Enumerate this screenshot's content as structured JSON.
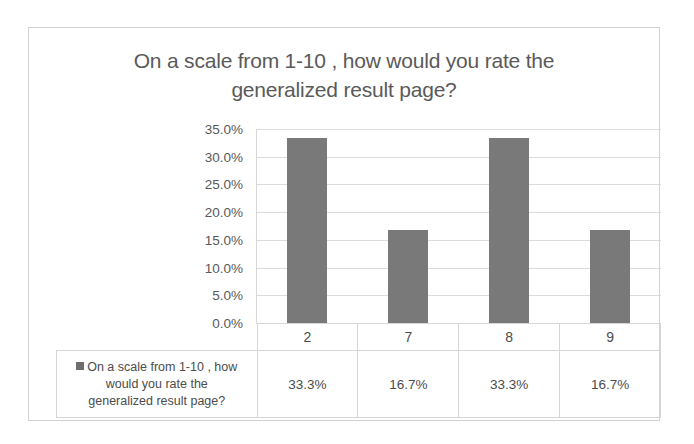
{
  "chart_data": {
    "type": "bar",
    "title": "On a scale from 1-10 , how would you rate the generalized result page?",
    "title_line1": "On a scale from 1-10 , how would you rate the",
    "title_line2": "generalized result page?",
    "xlabel": "",
    "ylabel": "",
    "categories": [
      "2",
      "7",
      "8",
      "9"
    ],
    "values": [
      33.3,
      16.7,
      33.3,
      16.7
    ],
    "value_labels": [
      "33.3%",
      "16.7%",
      "33.3%",
      "16.7%"
    ],
    "series": [
      {
        "name": "On a scale from 1-10 , how would you rate the generalized result page?",
        "values": [
          33.3,
          16.7,
          33.3,
          16.7
        ],
        "color": "#797979"
      }
    ],
    "ylim": [
      0,
      35
    ],
    "ytick_values": [
      35.0,
      30.0,
      25.0,
      20.0,
      15.0,
      10.0,
      5.0,
      0.0
    ],
    "ytick_labels": [
      "35.0%",
      "30.0%",
      "25.0%",
      "20.0%",
      "15.0%",
      "10.0%",
      "5.0%",
      "0.0%"
    ],
    "grid": true,
    "legend_position": "bottom-left-table",
    "data_table_visible": true
  },
  "legend": {
    "marker_color": "#6e6e6e",
    "label_line1": "On a scale from 1-10 , how",
    "label_line2": "would you rate the",
    "label_line3": "generalized result page?"
  }
}
